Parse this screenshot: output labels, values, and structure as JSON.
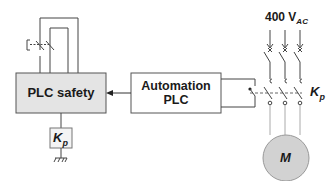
{
  "diagram": {
    "type": "electrical-safety-schematic",
    "nodes": {
      "plc_safety": {
        "label": "PLC safety",
        "fill": "#e4e4e4"
      },
      "automation_plc": {
        "label_line1": "Automation",
        "label_line2": "PLC",
        "fill": "#ffffff"
      },
      "kp_coil": {
        "label_main": "K",
        "label_sub": "p"
      },
      "motor": {
        "label": "M",
        "fill": "#d2d2d2"
      },
      "supply": {
        "label_main": "400 V",
        "label_sub": "AC"
      },
      "kp_contactor": {
        "label_main": "K",
        "label_sub": "p"
      }
    },
    "edges": [
      {
        "from": "automation_plc",
        "to": "plc_safety",
        "style": "arrow"
      },
      {
        "from": "emergency_stop",
        "to": "plc_safety",
        "style": "dual-channel-loop"
      },
      {
        "from": "plc_safety",
        "to": "kp_coil",
        "style": "line"
      },
      {
        "from": "kp_coil",
        "to": "ground",
        "style": "line"
      },
      {
        "from": "automation_plc",
        "to": "kp_contactor",
        "style": "control-line"
      },
      {
        "from": "supply",
        "to": "motor",
        "style": "three-phase-through-contactor"
      }
    ],
    "colors": {
      "line": "#333333",
      "box_border": "#555555"
    }
  }
}
